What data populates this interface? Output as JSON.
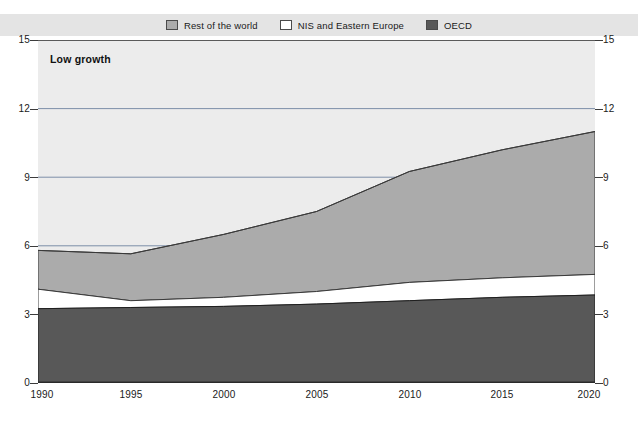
{
  "legend": {
    "items": [
      {
        "label": "Rest of the world",
        "swatch_name": "legend-swatch-rest-of-world",
        "color": "#ababab"
      },
      {
        "label": "NIS and Eastern Europe",
        "swatch_name": "legend-swatch-nis-eastern-europe",
        "color": "#ffffff"
      },
      {
        "label": "OECD",
        "swatch_name": "legend-swatch-oecd",
        "color": "#585858"
      }
    ],
    "strip_color": "#e4e4e4"
  },
  "annotation": {
    "title": "Low growth"
  },
  "axis": {
    "y_ticks_left": [
      "15",
      "12",
      "9",
      "6",
      "3",
      "0"
    ],
    "y_ticks_right": [
      "15",
      "12",
      "9",
      "6",
      "3",
      "0"
    ],
    "x_ticks": [
      "1990",
      "1995",
      "2000",
      "2005",
      "2010",
      "2015",
      "2020"
    ]
  },
  "chart_data": {
    "type": "area",
    "stacked": true,
    "title": "Low growth",
    "xlabel": "",
    "ylabel": "",
    "xlim": [
      1990,
      2020
    ],
    "ylim": [
      0,
      15
    ],
    "yticks": [
      0,
      3,
      6,
      9,
      12,
      15
    ],
    "xticks": [
      1990,
      1995,
      2000,
      2005,
      2010,
      2015,
      2020
    ],
    "grid": true,
    "grid_axis": "y",
    "legend_position": "top-center",
    "x": [
      1990,
      1995,
      2000,
      2005,
      2010,
      2015,
      2020
    ],
    "series": [
      {
        "name": "OECD",
        "color": "#585858",
        "values": [
          3.25,
          3.3,
          3.35,
          3.45,
          3.6,
          3.75,
          3.85
        ]
      },
      {
        "name": "NIS and Eastern Europe",
        "color": "#ffffff",
        "values": [
          0.85,
          0.3,
          0.4,
          0.55,
          0.8,
          0.85,
          0.9
        ]
      },
      {
        "name": "Rest of the world",
        "color": "#ababab",
        "values": [
          1.7,
          2.05,
          2.75,
          3.5,
          4.85,
          5.6,
          6.25
        ]
      }
    ],
    "cumulative_tops": {
      "oecd": [
        3.25,
        3.3,
        3.35,
        3.45,
        3.6,
        3.75,
        3.85
      ],
      "nis": [
        4.1,
        3.6,
        3.75,
        4.0,
        4.4,
        4.6,
        4.75
      ],
      "total": [
        5.8,
        5.65,
        6.5,
        7.5,
        9.25,
        10.2,
        11.0
      ]
    }
  }
}
